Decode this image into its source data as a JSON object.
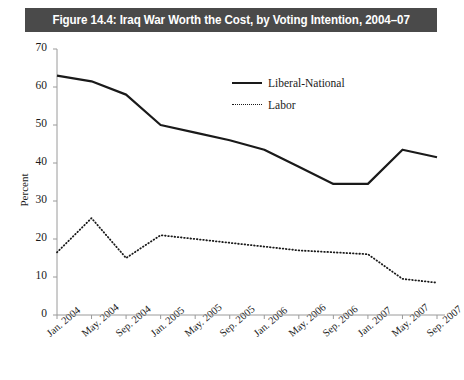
{
  "figure": {
    "title": "Figure 14.4: Iraq War Worth the Cost, by Voting Intention, 2004–07",
    "title_bar_color": "#4a4a4a",
    "title_text_color": "#ffffff",
    "background": "#ffffff",
    "line_color": "#1a1a1a"
  },
  "chart_data": {
    "type": "line",
    "title": "Figure 14.4: Iraq War Worth the Cost, by Voting Intention, 2004–07",
    "xlabel": "",
    "ylabel": "Percent",
    "ylim": [
      0,
      70
    ],
    "ytick_step": 10,
    "yticks": [
      0,
      10,
      20,
      30,
      40,
      50,
      60,
      70
    ],
    "grid": false,
    "legend_position": "upper-center-right",
    "categories": [
      "Jan. 2004",
      "May. 2004",
      "Sep. 2004",
      "Jan. 2005",
      "May. 2005",
      "Sep. 2005",
      "Jan. 2006",
      "May. 2006",
      "Sep. 2006",
      "Jan. 2007",
      "May. 2007",
      "Sep. 2007"
    ],
    "series": [
      {
        "name": "Liberal-National",
        "style": "solid",
        "color": "#1a1a1a",
        "values": [
          63,
          61.5,
          58,
          50,
          48,
          46,
          43.5,
          39,
          34.5,
          34.5,
          43.5,
          41.5
        ]
      },
      {
        "name": "Labor",
        "style": "dotted",
        "color": "#1a1a1a",
        "values": [
          16.5,
          25.5,
          15,
          21,
          20,
          19,
          18,
          17,
          16.5,
          16,
          9.5,
          8.5
        ]
      }
    ]
  },
  "legend": {
    "items": [
      {
        "label": "Liberal-National",
        "style": "solid"
      },
      {
        "label": "Labor",
        "style": "dotted"
      }
    ]
  }
}
